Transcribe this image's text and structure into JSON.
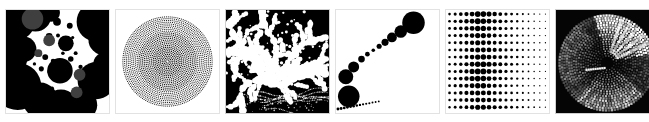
{
  "gallery": {
    "title": "Generative dot-pattern panel strip",
    "background_color": "#ffffff",
    "panel_count": 6,
    "panel_size_px": 105,
    "panel_gap_px": 5,
    "panels": [
      {
        "index": 1,
        "name": "overlapping-circles",
        "label": "Overlapping circle blobs",
        "background": "#ffffff",
        "ink": "#000000",
        "accent": "#4d4d4d",
        "description": "White field with large overlapping black circles of varied radius plus small scattered dots; a few circles are mid-gray where they overlap."
      },
      {
        "index": 2,
        "name": "concentric-rings",
        "label": "Concentric radial dot rings",
        "background": "#ffffff",
        "ink": "#000000",
        "accent": "#222222",
        "description": "Dense concentric rings of small square dots radiating from center, rings dissolve into discrete dots toward the outer edge."
      },
      {
        "index": 3,
        "name": "white-dendrite",
        "label": "White branching cloud on black",
        "background": "#000000",
        "ink": "#ffffff",
        "accent": "#bbbbbb",
        "description": "Black field with a white dendritic/branching blob cluster filling the upper area and thin wispy white trails sweeping across the lower area."
      },
      {
        "index": 4,
        "name": "flowing-arcs",
        "label": "Flowing dot arcs with size gradient",
        "background": "#ffffff",
        "ink": "#000000",
        "accent": "#111111",
        "description": "Curved diagonal bands of dots sweeping from lower-left to upper-right; a chain of large-to-small solid circles runs along the upper-left diagonal, fine hairline arcs at the top-left corner."
      },
      {
        "index": 5,
        "name": "halftone-grid",
        "label": "Halftone dot grid gradient",
        "background": "#ffffff",
        "ink": "#000000",
        "accent": "#000000",
        "grid_columns": 18,
        "grid_rows": 14,
        "description": "Regular grid of black dots whose diameter peaks near columns 5-7 and shrinks steadily toward the right edge."
      },
      {
        "index": 6,
        "name": "dark-radial-spiral",
        "label": "Inverted radial spiral disc",
        "background": "#000000",
        "ink": "#ffffff",
        "accent": "#8a8a8a",
        "description": "Near-black square containing a circular disc of white and gray dots arranged in spiralling radial arcs, brightest in the upper-right sector."
      }
    ]
  }
}
